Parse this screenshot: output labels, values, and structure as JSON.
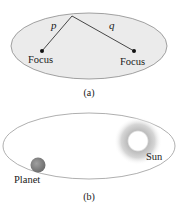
{
  "panel_a": {
    "caption": "(a)",
    "ellipse_fill": "#ebebeb",
    "ellipse_stroke": "#8a8a8a",
    "line_color": "#333333",
    "segment_labels": {
      "left": "p",
      "right": "q"
    },
    "foci": [
      {
        "label": "Focus"
      },
      {
        "label": "Focus"
      }
    ]
  },
  "panel_b": {
    "caption": "(b)",
    "orbit_stroke": "#9a9a9a",
    "sun": {
      "label": "Sun",
      "core_color": "#ffffff",
      "halo_color": "#9a9a9a"
    },
    "planet": {
      "label": "Planet",
      "color": "#8a8a8a"
    }
  }
}
